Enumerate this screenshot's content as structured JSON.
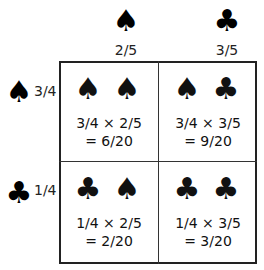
{
  "columns": [
    {
      "suit": "♠",
      "suit_name": "spade",
      "probability": "2/5"
    },
    {
      "suit": "♣",
      "suit_name": "club",
      "probability": "3/5"
    }
  ],
  "rows": [
    {
      "suit": "♠",
      "suit_name": "spade",
      "probability": "3/4"
    },
    {
      "suit": "♣",
      "suit_name": "club",
      "probability": "1/4"
    }
  ],
  "cells": [
    {
      "suits": [
        "♠",
        "♠"
      ],
      "expression": "3/4 × 2/5",
      "result": "= 6/20"
    },
    {
      "suits": [
        "♠",
        "♣"
      ],
      "expression": "3/4 × 3/5",
      "result": "= 9/20"
    },
    {
      "suits": [
        "♣",
        "♠"
      ],
      "expression": "1/4 × 2/5",
      "result": "= 2/20"
    },
    {
      "suits": [
        "♣",
        "♣"
      ],
      "expression": "1/4 × 3/5",
      "result": "= 3/20"
    }
  ]
}
